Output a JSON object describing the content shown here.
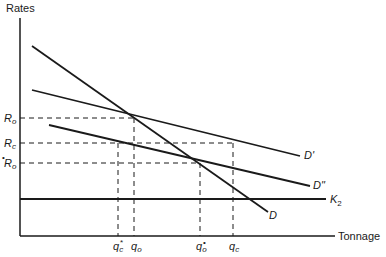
{
  "diagram": {
    "axes": {
      "y_label": "Rates",
      "x_label": "Tonnage"
    },
    "curves": [
      {
        "id": "D",
        "label": "D"
      },
      {
        "id": "D_prime",
        "label": "D'"
      },
      {
        "id": "D_double_prime",
        "label": "D\""
      },
      {
        "id": "K2",
        "label": "K",
        "subscript": "2"
      }
    ],
    "rate_levels": [
      {
        "id": "R_o",
        "base": "R",
        "sub": "o",
        "marker": ""
      },
      {
        "id": "R_c",
        "base": "R",
        "sub": "c",
        "marker": ""
      },
      {
        "id": "R_o_star",
        "base": "R",
        "sub": "o",
        "marker": "•"
      }
    ],
    "quantity_levels": [
      {
        "id": "q_c_star",
        "base": "q",
        "sub": "c",
        "marker": "*"
      },
      {
        "id": "q_o",
        "base": "q",
        "sub": "o",
        "marker": ""
      },
      {
        "id": "q_o_star",
        "base": "q",
        "sub": "o",
        "marker": "•"
      },
      {
        "id": "q_c",
        "base": "q",
        "sub": "c",
        "marker": ""
      }
    ],
    "colors": {
      "line": "#1a1a1a",
      "background": "#ffffff"
    }
  }
}
